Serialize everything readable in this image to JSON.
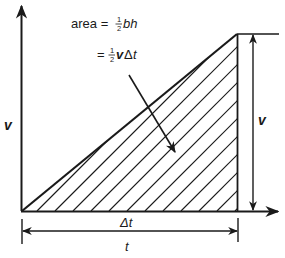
{
  "diagram": {
    "type": "velocity-time graph with triangular area",
    "formula": {
      "line1_prefix": "area = ",
      "line1_frac_num": "1",
      "line1_frac_den": "2",
      "line1_suffix": "bh",
      "line2_prefix": "= ",
      "line2_frac_num": "1",
      "line2_frac_den": "2",
      "line2_v": "v",
      "line2_delta": "Δ",
      "line2_t": "t"
    },
    "labels": {
      "y_axis": "v",
      "right_height": "v",
      "base_width": "Δt",
      "total_time": "t"
    },
    "colors": {
      "line": "#1a1a1a",
      "background": "#ffffff"
    },
    "geometry": {
      "origin": [
        22,
        211
      ],
      "apex": [
        237,
        34
      ],
      "base_right": [
        237,
        211
      ],
      "hatch_spacing_px": 18
    }
  }
}
